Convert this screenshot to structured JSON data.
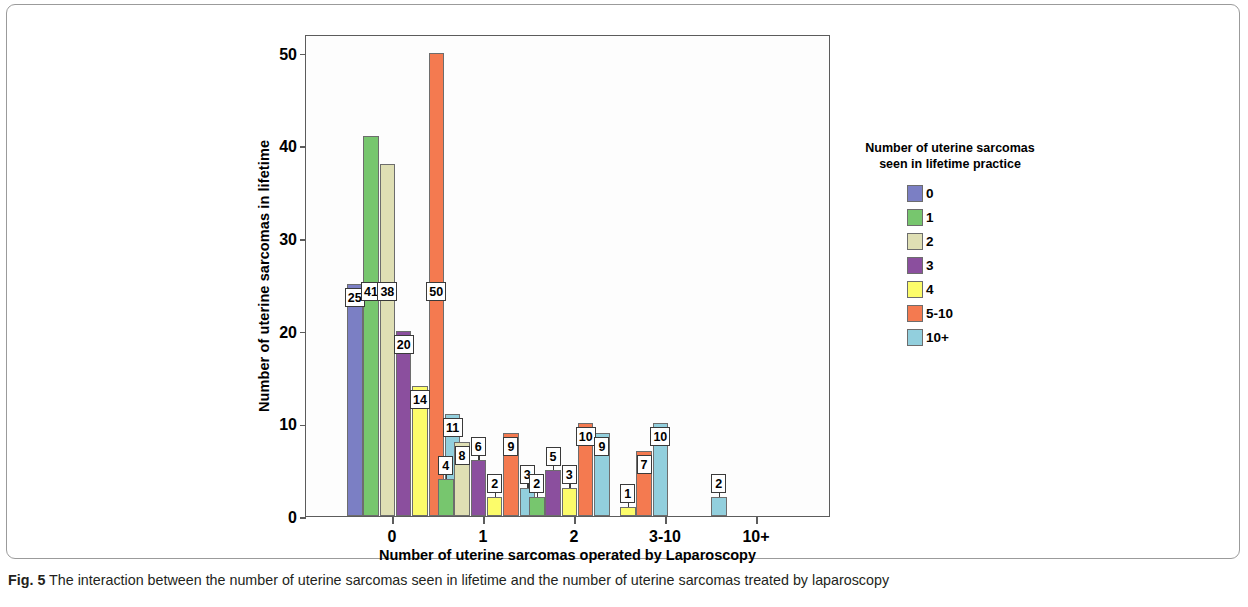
{
  "figure": {
    "caption_label": "Fig. 5",
    "caption_text": " The interaction between the number of uterine sarcomas seen in lifetime and the number of uterine sarcomas treated by laparoscopy"
  },
  "chart_data": {
    "type": "bar",
    "title": "",
    "xlabel": "Number of uterine sarcomas operated by Laparoscopy",
    "ylabel": "Number of uterine sarcomas in lifetime",
    "categories": [
      "0",
      "1",
      "2",
      "3-10",
      "10+"
    ],
    "ylim": [
      0,
      52
    ],
    "yticks": [
      0,
      10,
      20,
      30,
      40,
      50
    ],
    "ytick_labels": [
      "0",
      "10",
      "20",
      "30",
      "40",
      "50"
    ],
    "grid": false,
    "legend_position": "right",
    "legend_title": "Number of uterine sarcomas\nseen in lifetime practice",
    "legend_title_line1": "Number of uterine sarcomas",
    "legend_title_line2": "seen in lifetime practice",
    "colors": {
      "0": "#7b7fc4",
      "1": "#77c66e",
      "2": "#dfdfb4",
      "3": "#8b4f9e",
      "4": "#fcfc6a",
      "5-10": "#f47a50",
      "10+": "#92cfdd"
    },
    "series": [
      {
        "name": "0",
        "color": "#7b7fc4",
        "values": [
          25,
          null,
          null,
          null,
          null
        ]
      },
      {
        "name": "1",
        "color": "#77c66e",
        "values": [
          41,
          4,
          2,
          null,
          null
        ]
      },
      {
        "name": "2",
        "color": "#dfdfb4",
        "values": [
          38,
          8,
          null,
          null,
          null
        ]
      },
      {
        "name": "3",
        "color": "#8b4f9e",
        "values": [
          20,
          6,
          5,
          null,
          null
        ]
      },
      {
        "name": "4",
        "color": "#fcfc6a",
        "values": [
          14,
          2,
          3,
          1,
          null
        ]
      },
      {
        "name": "5-10",
        "color": "#f47a50",
        "values": [
          50,
          9,
          10,
          7,
          null
        ]
      },
      {
        "name": "10+",
        "color": "#92cfdd",
        "values": [
          11,
          3,
          9,
          10,
          2
        ]
      }
    ]
  }
}
